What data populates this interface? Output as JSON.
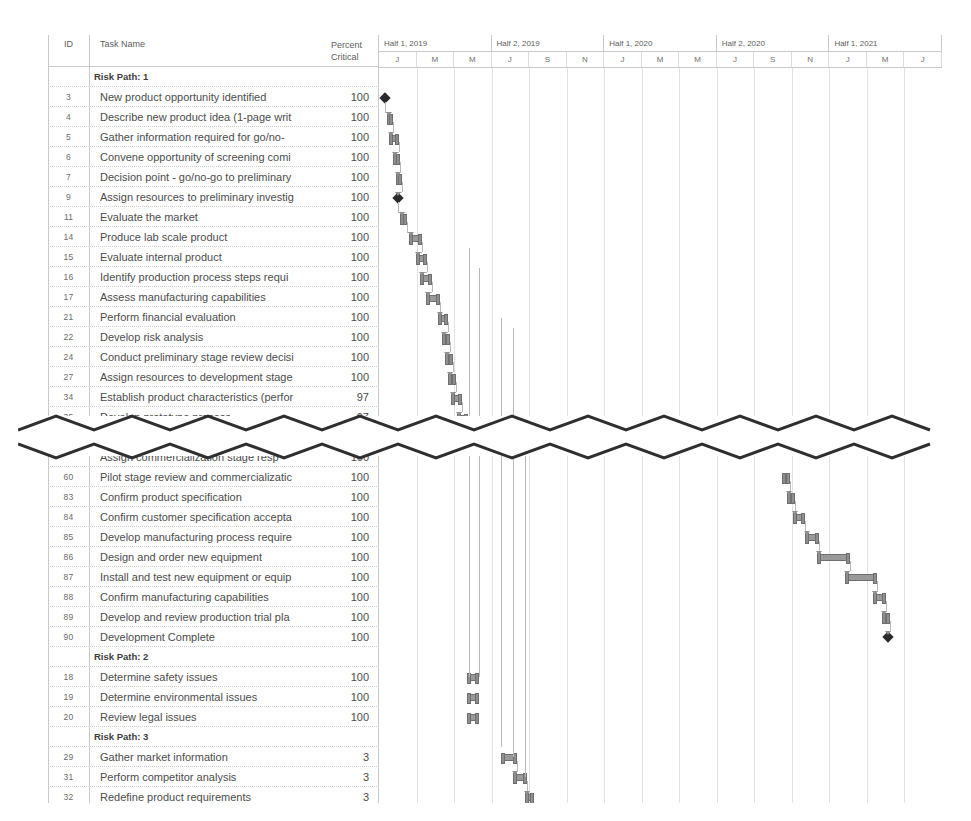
{
  "table": {
    "headers": {
      "id": "ID",
      "task_name": "Task Name",
      "percent_line1": "Percent",
      "percent_line2": "Critical"
    }
  },
  "timescale": {
    "major": [
      "Half 1, 2019",
      "Half 2, 2019",
      "Half 1, 2020",
      "Half 2, 2020",
      "Half 1, 2021"
    ],
    "minor": [
      "J",
      "M",
      "M",
      "J",
      "S",
      "N",
      "J",
      "M",
      "M",
      "J",
      "S",
      "N",
      "J",
      "M",
      "J"
    ]
  },
  "sections": [
    {
      "group_label": "Risk Path: 1",
      "rows": [
        {
          "id": "3",
          "name": "New product opportunity identified",
          "percent": "100"
        },
        {
          "id": "4",
          "name": "Describe new product idea (1-page writ",
          "percent": "100"
        },
        {
          "id": "5",
          "name": "Gather information required for go/no-",
          "percent": "100"
        },
        {
          "id": "6",
          "name": "Convene opportunity of screening comi",
          "percent": "100"
        },
        {
          "id": "7",
          "name": "Decision point - go/no-go to preliminary",
          "percent": "100"
        },
        {
          "id": "9",
          "name": "Assign resources to preliminary investig",
          "percent": "100"
        },
        {
          "id": "11",
          "name": "Evaluate the market",
          "percent": "100"
        },
        {
          "id": "14",
          "name": "Produce lab scale product",
          "percent": "100"
        },
        {
          "id": "15",
          "name": "Evaluate internal product",
          "percent": "100"
        },
        {
          "id": "16",
          "name": "Identify production process steps requi",
          "percent": "100"
        },
        {
          "id": "17",
          "name": "Assess manufacturing capabilities",
          "percent": "100"
        },
        {
          "id": "21",
          "name": "Perform financial evaluation",
          "percent": "100"
        },
        {
          "id": "22",
          "name": "Develop risk analysis",
          "percent": "100"
        },
        {
          "id": "24",
          "name": "Conduct preliminary stage review decisi",
          "percent": "100"
        },
        {
          "id": "27",
          "name": "Assign resources to development stage",
          "percent": "100"
        },
        {
          "id": "34",
          "name": "Establish product characteristics (perfor",
          "percent": "97"
        },
        {
          "id": "35",
          "name": "Develop prototype process",
          "percent": "97"
        },
        {
          "id": "36",
          "name": "Produce prototype product",
          "percent": "97"
        }
      ]
    }
  ],
  "section_lower": {
    "clipped_row": {
      "id": "",
      "name": "Assign commercialization stage resp",
      "percent": "100"
    },
    "rows": [
      {
        "id": "60",
        "name": "Pilot stage review and commercializatic",
        "percent": "100"
      },
      {
        "id": "83",
        "name": "Confirm product specification",
        "percent": "100"
      },
      {
        "id": "84",
        "name": "Confirm customer specification accepta",
        "percent": "100"
      },
      {
        "id": "85",
        "name": "Develop manufacturing process require",
        "percent": "100"
      },
      {
        "id": "86",
        "name": "Design and order new equipment",
        "percent": "100"
      },
      {
        "id": "87",
        "name": "Install and test new equipment or equip",
        "percent": "100"
      },
      {
        "id": "88",
        "name": "Confirm manufacturing capabilities",
        "percent": "100"
      },
      {
        "id": "89",
        "name": "Develop and review production trial pla",
        "percent": "100"
      },
      {
        "id": "90",
        "name": "Development Complete",
        "percent": "100"
      }
    ]
  },
  "section_rp2": {
    "group_label": "Risk Path: 2",
    "rows": [
      {
        "id": "18",
        "name": "Determine safety issues",
        "percent": "100"
      },
      {
        "id": "19",
        "name": "Determine environmental issues",
        "percent": "100"
      },
      {
        "id": "20",
        "name": "Review legal issues",
        "percent": "100"
      }
    ]
  },
  "section_rp3": {
    "group_label": "Risk Path: 3",
    "rows": [
      {
        "id": "29",
        "name": "Gather market information",
        "percent": "3"
      },
      {
        "id": "31",
        "name": "Perform competitor analysis",
        "percent": "3"
      },
      {
        "id": "32",
        "name": "Redefine product requirements",
        "percent": "3"
      }
    ]
  },
  "chart_data": {
    "type": "bar",
    "xlabel": "",
    "ylabel": "",
    "bars_top": [
      {
        "row_id": "3",
        "left": 6,
        "width": 0,
        "milestone": true
      },
      {
        "row_id": "4",
        "left": 8,
        "width": 6,
        "milestone": false
      },
      {
        "row_id": "5",
        "left": 10,
        "width": 10,
        "milestone": false
      },
      {
        "row_id": "6",
        "left": 14,
        "width": 7,
        "milestone": false
      },
      {
        "row_id": "7",
        "left": 17,
        "width": 6,
        "milestone": false
      },
      {
        "row_id": "9",
        "left": 19,
        "width": 0,
        "milestone": true
      },
      {
        "row_id": "11",
        "left": 21,
        "width": 7,
        "milestone": false
      },
      {
        "row_id": "14",
        "left": 30,
        "width": 13,
        "milestone": false
      },
      {
        "row_id": "15",
        "left": 37,
        "width": 11,
        "milestone": false
      },
      {
        "row_id": "16",
        "left": 41,
        "width": 12,
        "milestone": false
      },
      {
        "row_id": "17",
        "left": 47,
        "width": 14,
        "milestone": false
      },
      {
        "row_id": "21",
        "left": 59,
        "width": 10,
        "milestone": false
      },
      {
        "row_id": "22",
        "left": 63,
        "width": 8,
        "milestone": false
      },
      {
        "row_id": "24",
        "left": 66,
        "width": 8,
        "milestone": false
      },
      {
        "row_id": "27",
        "left": 69,
        "width": 8,
        "milestone": false
      },
      {
        "row_id": "34",
        "left": 72,
        "width": 11,
        "milestone": false
      },
      {
        "row_id": "35",
        "left": 78,
        "width": 11,
        "milestone": false
      },
      {
        "row_id": "36",
        "left": 83,
        "width": 34,
        "milestone": false
      }
    ],
    "bars_lower": [
      {
        "row_id": "60",
        "left": 403,
        "width": 8,
        "milestone": false
      },
      {
        "row_id": "83",
        "left": 408,
        "width": 8,
        "milestone": false
      },
      {
        "row_id": "84",
        "left": 414,
        "width": 12,
        "milestone": false
      },
      {
        "row_id": "85",
        "left": 426,
        "width": 14,
        "milestone": false
      },
      {
        "row_id": "86",
        "left": 438,
        "width": 33,
        "milestone": false
      },
      {
        "row_id": "87",
        "left": 466,
        "width": 32,
        "milestone": false
      },
      {
        "row_id": "88",
        "left": 494,
        "width": 13,
        "milestone": false
      },
      {
        "row_id": "89",
        "left": 503,
        "width": 8,
        "milestone": false
      },
      {
        "row_id": "90",
        "left": 509,
        "width": 0,
        "milestone": true
      }
    ],
    "bars_rp2": [
      {
        "row_id": "18",
        "left": 88,
        "width": 12,
        "milestone": false
      },
      {
        "row_id": "19",
        "left": 88,
        "width": 12,
        "milestone": false
      },
      {
        "row_id": "20",
        "left": 88,
        "width": 12,
        "milestone": false
      }
    ],
    "bars_rp3": [
      {
        "row_id": "29",
        "left": 122,
        "width": 16,
        "milestone": false
      },
      {
        "row_id": "31",
        "left": 134,
        "width": 14,
        "milestone": false
      },
      {
        "row_id": "32",
        "left": 146,
        "width": 9,
        "milestone": false
      }
    ]
  }
}
